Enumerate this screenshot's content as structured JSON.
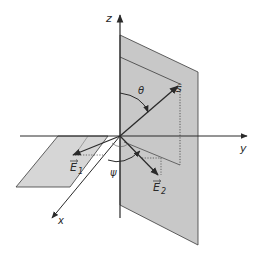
{
  "diagram": {
    "type": "3d-coordinate-geometry",
    "axes": {
      "z_label": "z",
      "y_label": "y",
      "x_label": "x"
    },
    "vectors": {
      "s_label": "ŝ",
      "e1_label": "E",
      "e1_sub": "1",
      "e2_label": "E",
      "e2_sub": "2"
    },
    "angles": {
      "theta_label": "θ",
      "psi_label": "ψ"
    },
    "colors": {
      "line": "#2a2a2a",
      "vertical_plane": "#c8c8c8",
      "horizontal_plane": "#d6d6d6",
      "background": "#ffffff"
    }
  }
}
